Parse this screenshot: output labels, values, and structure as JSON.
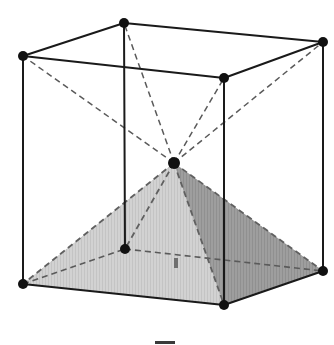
{
  "figure": {
    "background_color": "#ffffff",
    "canvas": {
      "width": 334,
      "height": 345
    }
  },
  "colors": {
    "edge_solid": "#1a1a1a",
    "edge_hidden": "#555555",
    "vertex_dot": "#111111",
    "face_light": "#cfcfcf",
    "face_mid": "#bdbdbd",
    "face_dark": "#9b9b9b",
    "face_base": "#e2e2e2",
    "caption_mark": "#3a3a3a"
  },
  "geometry": {
    "cube_vertices": [
      {
        "name": "top-back-left",
        "id": "A",
        "x": 23,
        "y": 56,
        "hidden": false
      },
      {
        "name": "top-back-right",
        "id": "B",
        "x": 124,
        "y": 23,
        "hidden": false
      },
      {
        "name": "top-front-right",
        "id": "C",
        "x": 323,
        "y": 42,
        "hidden": false
      },
      {
        "name": "top-front-left",
        "id": "D",
        "x": 224,
        "y": 78,
        "hidden": false
      },
      {
        "name": "bottom-back-left",
        "id": "E",
        "x": 23,
        "y": 284,
        "hidden": false
      },
      {
        "name": "bottom-back-right",
        "id": "F",
        "x": 125,
        "y": 249,
        "hidden": true
      },
      {
        "name": "bottom-front-right",
        "id": "G",
        "x": 323,
        "y": 271,
        "hidden": false
      },
      {
        "name": "bottom-front-left",
        "id": "H",
        "x": 224,
        "y": 305,
        "hidden": false
      }
    ],
    "apex": {
      "name": "pyramid-apex-cube-centre",
      "id": "P",
      "x": 174,
      "y": 163
    },
    "solid_edges": [
      {
        "name": "top-edge-A-B",
        "from": "A",
        "to": "B"
      },
      {
        "name": "top-edge-B-C",
        "from": "B",
        "to": "C"
      },
      {
        "name": "top-edge-C-D",
        "from": "C",
        "to": "D"
      },
      {
        "name": "top-edge-D-A",
        "from": "D",
        "to": "A"
      },
      {
        "name": "vertical-edge-A-E",
        "from": "A",
        "to": "E"
      },
      {
        "name": "vertical-edge-B-F",
        "from": "B",
        "to": "F"
      },
      {
        "name": "vertical-edge-C-G",
        "from": "C",
        "to": "G"
      },
      {
        "name": "vertical-edge-D-H",
        "from": "D",
        "to": "H"
      },
      {
        "name": "bottom-edge-E-H",
        "from": "E",
        "to": "H"
      },
      {
        "name": "bottom-edge-H-G",
        "from": "H",
        "to": "G"
      }
    ],
    "hidden_edges": [
      {
        "name": "bottom-edge-E-F",
        "from": "E",
        "to": "F"
      },
      {
        "name": "bottom-edge-F-G",
        "from": "F",
        "to": "G"
      }
    ],
    "apex_to_top_rays": [
      {
        "name": "ray-apex-A",
        "to": "A"
      },
      {
        "name": "ray-apex-B",
        "to": "B"
      },
      {
        "name": "ray-apex-C",
        "to": "C"
      },
      {
        "name": "ray-apex-D",
        "to": "D"
      }
    ],
    "pyramid_lateral_edges": [
      {
        "name": "pyramid-edge-apex-E",
        "to": "E",
        "style": "dashed"
      },
      {
        "name": "pyramid-edge-apex-F",
        "to": "F",
        "style": "dashed"
      },
      {
        "name": "pyramid-edge-apex-G",
        "to": "G",
        "style": "dashed"
      },
      {
        "name": "pyramid-edge-apex-H",
        "to": "H",
        "style": "dashed"
      }
    ],
    "pyramid_faces": [
      {
        "name": "pyramid-face-left",
        "vertices": [
          "P",
          "E",
          "H"
        ],
        "shade": "face_light"
      },
      {
        "name": "pyramid-face-right",
        "vertices": [
          "P",
          "H",
          "G"
        ],
        "shade": "face_dark"
      },
      {
        "name": "pyramid-face-back-left",
        "vertices": [
          "P",
          "E",
          "F"
        ],
        "shade": "face_mid"
      },
      {
        "name": "pyramid-face-back-right",
        "vertices": [
          "P",
          "F",
          "G"
        ],
        "shade": "face_mid"
      }
    ],
    "base_face": {
      "name": "cube-bottom-face",
      "vertices": [
        "E",
        "F",
        "G",
        "H"
      ],
      "shade": "face_base"
    }
  },
  "artifacts": {
    "caption_mark": {
      "name": "cropped-caption-mark",
      "x": 155,
      "y": 341,
      "width": 20,
      "height": 3
    },
    "inner_speck": {
      "name": "scan-speck",
      "x": 174,
      "y": 258,
      "width": 4,
      "height": 10
    }
  }
}
